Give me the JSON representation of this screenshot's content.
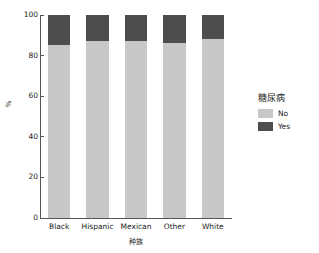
{
  "chart_data": {
    "type": "bar",
    "subtype": "stacked-percent",
    "title": "",
    "xlabel": "种族",
    "ylabel": "%",
    "categories": [
      "Black",
      "Hispanic",
      "Mexican",
      "Other",
      "White"
    ],
    "series": [
      {
        "name": "No",
        "color": "#c8c8c8",
        "values": [
          85.2,
          87.2,
          87.0,
          86.4,
          88.2
        ]
      },
      {
        "name": "Yes",
        "color": "#4d4d4d",
        "values": [
          14.8,
          12.8,
          13.0,
          13.6,
          11.8
        ]
      }
    ],
    "ylim": [
      0,
      100
    ],
    "yticks": [
      0,
      20,
      40,
      60,
      80,
      100
    ],
    "ytick_labels": [
      "0",
      "20",
      "40",
      "60",
      "80",
      "100"
    ],
    "grid": false,
    "legend": {
      "title": "糖尿病",
      "position": "right",
      "entries": [
        "No",
        "Yes"
      ]
    }
  },
  "axes": {
    "y_title": "%",
    "x_title": "种族",
    "axis_color": "#555555"
  },
  "legend": {
    "title": "糖尿病",
    "items": [
      {
        "label": "No",
        "color": "#c8c8c8"
      },
      {
        "label": "Yes",
        "color": "#4d4d4d"
      }
    ]
  }
}
